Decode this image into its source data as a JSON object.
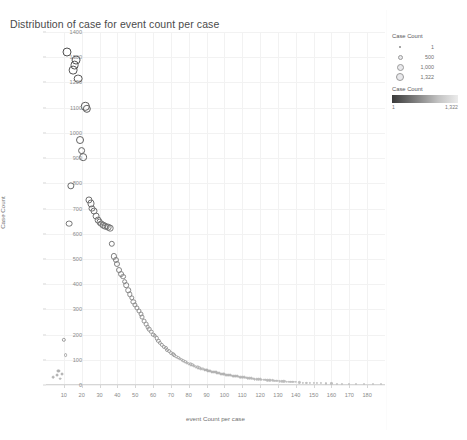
{
  "title": "Distribution of case for event count per case",
  "axis": {
    "x_title": "event Count per case",
    "y_title": "Case Count",
    "x_ticks": [
      "10",
      "20",
      "30",
      "40",
      "50",
      "60",
      "70",
      "80",
      "90",
      "100",
      "110",
      "120",
      "130",
      "140",
      "150",
      "160",
      "170",
      "180"
    ],
    "y_ticks": [
      "1400",
      "1300",
      "1200",
      "1100",
      "1000",
      "900",
      "800",
      "700",
      "600",
      "500",
      "400",
      "300",
      "200",
      "100",
      "0"
    ]
  },
  "legends": {
    "size": {
      "title": "Case Count",
      "entries": [
        {
          "label": "1",
          "size": 2
        },
        {
          "label": "500",
          "size": 5
        },
        {
          "label": "1,000",
          "size": 7
        },
        {
          "label": "1,322",
          "size": 8.5
        }
      ]
    },
    "color": {
      "title": "Case Count",
      "min": "1",
      "max": "1,322",
      "ramp_start": "#3a3a3a",
      "ramp_end": "#ececec"
    }
  },
  "chart_data": {
    "type": "scatter",
    "title": "Distribution of case for event count per case",
    "xlabel": "event Count per case",
    "ylabel": "Case Count",
    "xlim": [
      0,
      190
    ],
    "ylim": [
      0,
      1400
    ],
    "grid": true,
    "legend_position": "right",
    "size_encoding": "Case Count",
    "color_encoding": "Case Count",
    "points": [
      {
        "x": 4,
        "y": 30
      },
      {
        "x": 6,
        "y": 40
      },
      {
        "x": 7,
        "y": 55
      },
      {
        "x": 8,
        "y": 25
      },
      {
        "x": 9,
        "y": 45
      },
      {
        "x": 10,
        "y": 180
      },
      {
        "x": 11,
        "y": 120
      },
      {
        "x": 12,
        "y": 1322
      },
      {
        "x": 13,
        "y": 640
      },
      {
        "x": 14,
        "y": 790
      },
      {
        "x": 15,
        "y": 1250
      },
      {
        "x": 16,
        "y": 1270
      },
      {
        "x": 17,
        "y": 1290
      },
      {
        "x": 18,
        "y": 1215
      },
      {
        "x": 19,
        "y": 970
      },
      {
        "x": 20,
        "y": 930
      },
      {
        "x": 21,
        "y": 905
      },
      {
        "x": 22,
        "y": 1105
      },
      {
        "x": 23,
        "y": 1095
      },
      {
        "x": 24,
        "y": 735
      },
      {
        "x": 25,
        "y": 720
      },
      {
        "x": 26,
        "y": 700
      },
      {
        "x": 27,
        "y": 690
      },
      {
        "x": 28,
        "y": 670
      },
      {
        "x": 29,
        "y": 655
      },
      {
        "x": 30,
        "y": 645
      },
      {
        "x": 31,
        "y": 640
      },
      {
        "x": 32,
        "y": 635
      },
      {
        "x": 33,
        "y": 630
      },
      {
        "x": 34,
        "y": 628
      },
      {
        "x": 35,
        "y": 626
      },
      {
        "x": 36,
        "y": 622
      },
      {
        "x": 37,
        "y": 560
      },
      {
        "x": 38,
        "y": 510
      },
      {
        "x": 39,
        "y": 495
      },
      {
        "x": 40,
        "y": 480
      },
      {
        "x": 41,
        "y": 455
      },
      {
        "x": 42,
        "y": 440
      },
      {
        "x": 43,
        "y": 430
      },
      {
        "x": 44,
        "y": 410
      },
      {
        "x": 45,
        "y": 395
      },
      {
        "x": 46,
        "y": 375
      },
      {
        "x": 47,
        "y": 360
      },
      {
        "x": 48,
        "y": 345
      },
      {
        "x": 49,
        "y": 330
      },
      {
        "x": 50,
        "y": 318
      },
      {
        "x": 51,
        "y": 305
      },
      {
        "x": 52,
        "y": 292
      },
      {
        "x": 53,
        "y": 280
      },
      {
        "x": 54,
        "y": 268
      },
      {
        "x": 55,
        "y": 252
      },
      {
        "x": 56,
        "y": 240
      },
      {
        "x": 57,
        "y": 230
      },
      {
        "x": 58,
        "y": 222
      },
      {
        "x": 59,
        "y": 212
      },
      {
        "x": 60,
        "y": 200
      },
      {
        "x": 61,
        "y": 195
      },
      {
        "x": 62,
        "y": 185
      },
      {
        "x": 63,
        "y": 176
      },
      {
        "x": 64,
        "y": 168
      },
      {
        "x": 65,
        "y": 160
      },
      {
        "x": 66,
        "y": 152
      },
      {
        "x": 67,
        "y": 146
      },
      {
        "x": 68,
        "y": 140
      },
      {
        "x": 69,
        "y": 134
      },
      {
        "x": 70,
        "y": 128
      },
      {
        "x": 71,
        "y": 122
      },
      {
        "x": 72,
        "y": 118
      },
      {
        "x": 73,
        "y": 113
      },
      {
        "x": 74,
        "y": 108
      },
      {
        "x": 75,
        "y": 104
      },
      {
        "x": 76,
        "y": 100
      },
      {
        "x": 77,
        "y": 96
      },
      {
        "x": 78,
        "y": 92
      },
      {
        "x": 79,
        "y": 88
      },
      {
        "x": 80,
        "y": 85
      },
      {
        "x": 81,
        "y": 82
      },
      {
        "x": 82,
        "y": 79
      },
      {
        "x": 83,
        "y": 76
      },
      {
        "x": 84,
        "y": 73
      },
      {
        "x": 85,
        "y": 70
      },
      {
        "x": 86,
        "y": 68
      },
      {
        "x": 87,
        "y": 65
      },
      {
        "x": 88,
        "y": 63
      },
      {
        "x": 89,
        "y": 61
      },
      {
        "x": 90,
        "y": 59
      },
      {
        "x": 91,
        "y": 57
      },
      {
        "x": 92,
        "y": 55
      },
      {
        "x": 93,
        "y": 53
      },
      {
        "x": 94,
        "y": 51
      },
      {
        "x": 95,
        "y": 50
      },
      {
        "x": 96,
        "y": 48
      },
      {
        "x": 97,
        "y": 46
      },
      {
        "x": 98,
        "y": 45
      },
      {
        "x": 99,
        "y": 44
      },
      {
        "x": 100,
        "y": 42
      },
      {
        "x": 101,
        "y": 41
      },
      {
        "x": 102,
        "y": 40
      },
      {
        "x": 103,
        "y": 38
      },
      {
        "x": 104,
        "y": 37
      },
      {
        "x": 105,
        "y": 36
      },
      {
        "x": 106,
        "y": 35
      },
      {
        "x": 107,
        "y": 34
      },
      {
        "x": 108,
        "y": 33
      },
      {
        "x": 109,
        "y": 32
      },
      {
        "x": 110,
        "y": 31
      },
      {
        "x": 111,
        "y": 30
      },
      {
        "x": 112,
        "y": 29
      },
      {
        "x": 113,
        "y": 28
      },
      {
        "x": 114,
        "y": 27
      },
      {
        "x": 115,
        "y": 26
      },
      {
        "x": 116,
        "y": 25
      },
      {
        "x": 117,
        "y": 24
      },
      {
        "x": 118,
        "y": 24
      },
      {
        "x": 119,
        "y": 23
      },
      {
        "x": 120,
        "y": 22
      },
      {
        "x": 121,
        "y": 21
      },
      {
        "x": 122,
        "y": 21
      },
      {
        "x": 123,
        "y": 20
      },
      {
        "x": 124,
        "y": 19
      },
      {
        "x": 125,
        "y": 19
      },
      {
        "x": 126,
        "y": 18
      },
      {
        "x": 127,
        "y": 18
      },
      {
        "x": 128,
        "y": 17
      },
      {
        "x": 129,
        "y": 16
      },
      {
        "x": 130,
        "y": 16
      },
      {
        "x": 131,
        "y": 15
      },
      {
        "x": 132,
        "y": 15
      },
      {
        "x": 133,
        "y": 14
      },
      {
        "x": 134,
        "y": 14
      },
      {
        "x": 135,
        "y": 13
      },
      {
        "x": 136,
        "y": 13
      },
      {
        "x": 137,
        "y": 12
      },
      {
        "x": 138,
        "y": 12
      },
      {
        "x": 139,
        "y": 11
      },
      {
        "x": 140,
        "y": 11
      },
      {
        "x": 142,
        "y": 10
      },
      {
        "x": 144,
        "y": 9
      },
      {
        "x": 146,
        "y": 9
      },
      {
        "x": 148,
        "y": 8
      },
      {
        "x": 150,
        "y": 8
      },
      {
        "x": 152,
        "y": 7
      },
      {
        "x": 154,
        "y": 7
      },
      {
        "x": 157,
        "y": 6
      },
      {
        "x": 160,
        "y": 6
      },
      {
        "x": 163,
        "y": 5
      },
      {
        "x": 166,
        "y": 5
      },
      {
        "x": 170,
        "y": 4
      },
      {
        "x": 174,
        "y": 4
      },
      {
        "x": 178,
        "y": 3
      },
      {
        "x": 183,
        "y": 3
      },
      {
        "x": 188,
        "y": 2
      }
    ]
  }
}
